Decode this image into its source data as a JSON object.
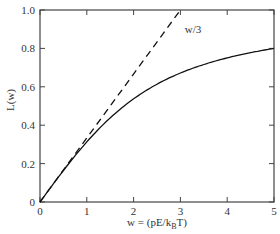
{
  "chart_data": {
    "type": "line",
    "title": "",
    "xlabel": "w = (pE/k_B T)",
    "xlabel_parts": {
      "pre": "w = (pE/k",
      "sub": "B",
      "post": "T)"
    },
    "ylabel": "L(w)",
    "xlim": [
      0,
      5
    ],
    "ylim": [
      0,
      1.0
    ],
    "x_ticks": [
      "0",
      "1",
      "2",
      "3",
      "4",
      "5"
    ],
    "y_ticks": [
      "0",
      "0.2",
      "0.4",
      "0.6",
      "0.8",
      "1.0"
    ],
    "grid": false,
    "legend": null,
    "annotations": [
      {
        "text": "w/3",
        "x": 3.05,
        "y": 0.9
      }
    ],
    "series": [
      {
        "name": "L(w)",
        "style": "solid",
        "x": [
          0,
          0.25,
          0.5,
          0.75,
          1.0,
          1.5,
          2.0,
          2.5,
          3.0,
          3.5,
          4.0,
          4.5,
          5.0
        ],
        "y": [
          0,
          0.083,
          0.164,
          0.243,
          0.313,
          0.438,
          0.537,
          0.612,
          0.672,
          0.716,
          0.75,
          0.778,
          0.8
        ]
      },
      {
        "name": "w/3",
        "style": "dashed",
        "x": [
          0,
          3.0
        ],
        "y": [
          0,
          1.0
        ]
      }
    ]
  }
}
